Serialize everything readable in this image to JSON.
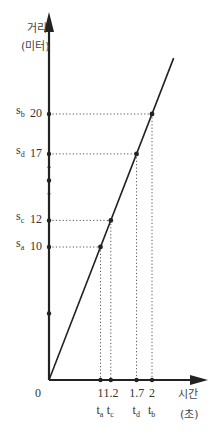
{
  "chart_data": {
    "type": "line",
    "title": "",
    "xlabel": "시간 (초)",
    "ylabel": "거리 (미터)",
    "xlabel_line1": "시간",
    "xlabel_line2": "(초)",
    "ylabel_line1": "거리",
    "ylabel_line2": "(미터)",
    "origin_label": "0",
    "xlim": [
      0,
      2.5
    ],
    "ylim": [
      0,
      25
    ],
    "grid": false,
    "legend": null,
    "series": [
      {
        "name": "distance vs time",
        "x": [
          0,
          1,
          1.2,
          1.7,
          2
        ],
        "y": [
          0,
          10,
          12,
          17,
          20
        ]
      }
    ],
    "points": [
      {
        "t_label": "t",
        "t_sub": "a",
        "s_label": "s",
        "s_sub": "a",
        "t": 1,
        "s": 10,
        "t_tick": "1",
        "s_tick": "10"
      },
      {
        "t_label": "t",
        "t_sub": "c",
        "s_label": "s",
        "s_sub": "c",
        "t": 1.2,
        "s": 12,
        "t_tick": "1.2",
        "s_tick": "12"
      },
      {
        "t_label": "t",
        "t_sub": "d",
        "s_label": "s",
        "s_sub": "d",
        "t": 1.7,
        "s": 17,
        "t_tick": "1.7",
        "s_tick": "17"
      },
      {
        "t_label": "t",
        "t_sub": "b",
        "s_label": "s",
        "s_sub": "b",
        "t": 2,
        "s": 20,
        "t_tick": "2",
        "s_tick": "20"
      }
    ],
    "minor_y_ticks": [
      5,
      14,
      15,
      16
    ],
    "annotations": [
      "s_a",
      "s_b",
      "s_c",
      "s_d",
      "t_a",
      "t_b",
      "t_c",
      "t_d"
    ],
    "colors": {
      "line": "#222222",
      "axis": "#222222",
      "guide": "#555555",
      "text": "#333333"
    }
  }
}
